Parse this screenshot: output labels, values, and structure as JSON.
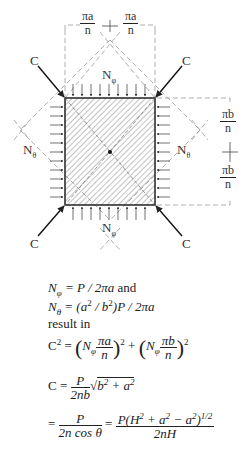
{
  "diagram": {
    "labels": {
      "force_top_left": "C",
      "force_top_right": "C",
      "force_bottom_left": "C",
      "force_bottom_right": "C",
      "n_phi_top": "N",
      "n_phi_bottom": "N",
      "n_theta_left": "N",
      "n_theta_right": "N",
      "sub_phi": "φ",
      "sub_theta": "θ",
      "top_dim_num": "πa",
      "top_dim_den": "n",
      "right_dim_num": "πb",
      "right_dim_den": "n"
    }
  },
  "equations": {
    "line1": {
      "lhs": "N",
      "sub": "φ",
      "rhs": " = P / 2πa",
      "tail": " and"
    },
    "line2": {
      "lhs": "N",
      "sub": "θ",
      "rhs_a": " = (a",
      "sup1": "2",
      "rhs_b": " / b",
      "sup2": "2",
      "rhs_c": ")P / 2πa"
    },
    "line3": {
      "text": "result in"
    },
    "line4": {
      "lhs": "C",
      "sup": "2",
      "eq": " = ",
      "n1": "N",
      "s1": "φ",
      "num1": "πa",
      "den1": "n",
      "plus": " + ",
      "n2": "N",
      "s2": "φ",
      "num2": "πb",
      "den2": "n",
      "sq": "2"
    },
    "line5": {
      "lhs": "C = ",
      "num": "P",
      "den": "2nb",
      "root": "b",
      "r_sup1": "2",
      "root_mid": " + a",
      "r_sup2": "2"
    },
    "line6": {
      "eq": "= ",
      "num1": "P",
      "den1": "2n cos θ",
      "eq2": " = ",
      "num2a": "P(H",
      "num2_s1": "2",
      "num2b": " + a",
      "num2_s2": "2",
      "num2c": " − a",
      "num2_s3": "2",
      "num2d": ")",
      "num2_s4": "1/2",
      "den2": "2nH"
    }
  }
}
